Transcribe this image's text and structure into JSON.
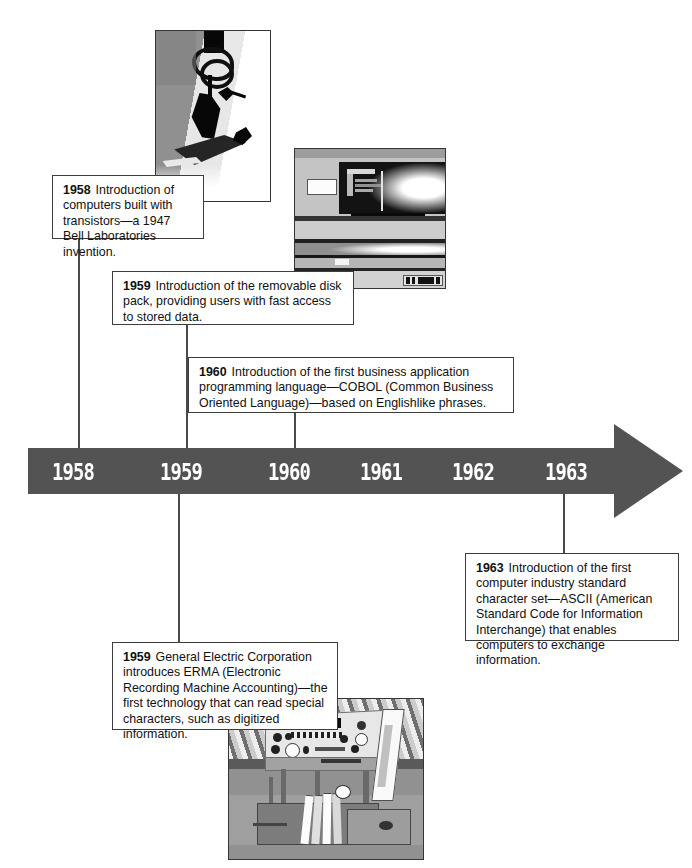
{
  "figure": {
    "kind": "history-timeline",
    "band_color": "#535353",
    "text_color": "#111111",
    "box_border_color": "#3d3d3d"
  },
  "timeline": {
    "years": [
      {
        "label": "1958",
        "x": 52
      },
      {
        "label": "1959",
        "x": 160
      },
      {
        "label": "1960",
        "x": 268
      },
      {
        "label": "1961",
        "x": 360
      },
      {
        "label": "1962",
        "x": 452
      },
      {
        "label": "1963",
        "x": 545
      }
    ]
  },
  "callouts": [
    {
      "id": "callout-1958-transistors",
      "year": "1958",
      "text": "Introduction of computers built with transistors—a 1947 Bell Laboratories invention."
    },
    {
      "id": "callout-1959-diskpack",
      "year": "1959",
      "text": "Introduction of the removable disk pack, providing users with fast access to stored data."
    },
    {
      "id": "callout-1960-cobol",
      "year": "1960",
      "text": "Introduction of the first business application programming language—COBOL (Common Business Oriented Language)—based on Englishlike phrases."
    },
    {
      "id": "callout-1963-ascii",
      "year": "1963",
      "text": "Introduction of the first computer industry standard character set—ASCII (American Standard Code for Information Interchange) that enables computers to exchange information."
    },
    {
      "id": "callout-1959-erma",
      "year": "1959",
      "text": "General Electric Corporation introduces ERMA (Electronic Recording Machine Accounting)—the first technology that can read special characters, such as digitized information."
    }
  ],
  "photos": [
    {
      "id": "photo-transistor",
      "caption_ref": "1958",
      "subject": "first transistor device with looped wire on metal base"
    },
    {
      "id": "photo-disk-drive",
      "caption_ref": "1959",
      "subject": "IBM removable disk pack drive cabinet",
      "badge_text": "IBM"
    },
    {
      "id": "photo-erma",
      "caption_ref": "1959",
      "subject": "ERMA check sorting and reading machine",
      "nameplate_text": "ERMA"
    }
  ]
}
